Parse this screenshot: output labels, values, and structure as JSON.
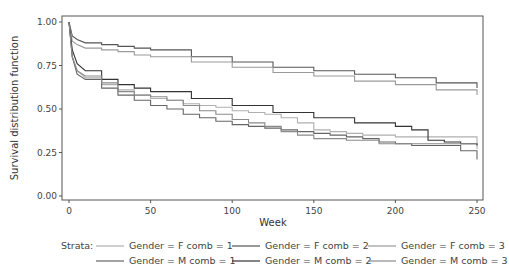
{
  "chart_data": {
    "type": "line",
    "title": "",
    "xlabel": "Week",
    "ylabel": "Survival distribution function",
    "xlim": [
      0,
      250
    ],
    "ylim": [
      0,
      1
    ],
    "xticks": [
      "0",
      "50",
      "100",
      "150",
      "200",
      "250"
    ],
    "yticks": [
      "0.00",
      "0.25",
      "0.50",
      "0.75",
      "1.00"
    ],
    "grid": false,
    "legend_position": "bottom",
    "legend_title": "Strata:",
    "step": true,
    "series": [
      {
        "name": "Gender = F comb = 1",
        "color": "#b0b0b0",
        "x": [
          0,
          2,
          5,
          10,
          20,
          30,
          40,
          50,
          60,
          70,
          80,
          90,
          100,
          110,
          120,
          130,
          140,
          150,
          160,
          170,
          180,
          190,
          200,
          210,
          220,
          230,
          240,
          250
        ],
        "y": [
          1.0,
          0.8,
          0.72,
          0.68,
          0.64,
          0.61,
          0.58,
          0.56,
          0.55,
          0.53,
          0.52,
          0.51,
          0.49,
          0.48,
          0.47,
          0.45,
          0.42,
          0.38,
          0.37,
          0.36,
          0.35,
          0.35,
          0.34,
          0.34,
          0.34,
          0.34,
          0.34,
          0.27
        ]
      },
      {
        "name": "Gender = F comb = 2",
        "color": "#555555",
        "x": [
          0,
          2,
          5,
          10,
          20,
          30,
          40,
          50,
          75,
          100,
          125,
          150,
          175,
          200,
          225,
          250
        ],
        "y": [
          1.0,
          0.92,
          0.9,
          0.88,
          0.87,
          0.86,
          0.85,
          0.84,
          0.8,
          0.77,
          0.74,
          0.72,
          0.7,
          0.68,
          0.65,
          0.62
        ]
      },
      {
        "name": "Gender = F comb = 3",
        "color": "#9a9a9a",
        "x": [
          0,
          2,
          5,
          10,
          20,
          30,
          40,
          50,
          75,
          100,
          125,
          150,
          175,
          200,
          225,
          250
        ],
        "y": [
          1.0,
          0.89,
          0.87,
          0.85,
          0.84,
          0.83,
          0.81,
          0.8,
          0.77,
          0.74,
          0.71,
          0.69,
          0.66,
          0.64,
          0.61,
          0.58
        ]
      },
      {
        "name": "Gender = M comb = 1",
        "color": "#666666",
        "x": [
          0,
          2,
          5,
          10,
          20,
          30,
          40,
          50,
          60,
          70,
          80,
          90,
          100,
          110,
          120,
          130,
          140,
          150,
          160,
          170,
          180,
          190,
          200,
          210,
          220,
          230,
          240,
          250
        ],
        "y": [
          1.0,
          0.8,
          0.7,
          0.67,
          0.62,
          0.58,
          0.55,
          0.52,
          0.5,
          0.47,
          0.45,
          0.43,
          0.41,
          0.4,
          0.39,
          0.38,
          0.37,
          0.36,
          0.35,
          0.34,
          0.33,
          0.31,
          0.3,
          0.29,
          0.29,
          0.29,
          0.26,
          0.21
        ]
      },
      {
        "name": "Gender = M comb = 2",
        "color": "#333333",
        "x": [
          0,
          2,
          5,
          10,
          20,
          30,
          40,
          50,
          75,
          100,
          125,
          150,
          175,
          200,
          210,
          220,
          230,
          240,
          250
        ],
        "y": [
          1.0,
          0.84,
          0.76,
          0.72,
          0.67,
          0.64,
          0.62,
          0.6,
          0.56,
          0.52,
          0.48,
          0.45,
          0.42,
          0.4,
          0.38,
          0.32,
          0.31,
          0.3,
          0.29
        ]
      },
      {
        "name": "Gender = M comb = 3",
        "color": "#8a8a8a",
        "x": [
          0,
          2,
          5,
          10,
          20,
          30,
          40,
          50,
          60,
          70,
          80,
          90,
          100,
          110,
          120,
          130,
          140,
          150,
          160,
          170,
          180,
          190,
          200,
          210,
          220,
          230,
          240,
          250
        ],
        "y": [
          1.0,
          0.8,
          0.72,
          0.69,
          0.65,
          0.6,
          0.58,
          0.57,
          0.55,
          0.52,
          0.49,
          0.47,
          0.44,
          0.42,
          0.4,
          0.37,
          0.35,
          0.33,
          0.33,
          0.32,
          0.32,
          0.3,
          0.3,
          0.3,
          0.3,
          0.3,
          0.3,
          0.3
        ]
      }
    ]
  },
  "legend": {
    "title": "Strata:",
    "items": [
      {
        "label": "Gender = F comb = 1",
        "color": "#b0b0b0"
      },
      {
        "label": "Gender = F comb = 2",
        "color": "#555555"
      },
      {
        "label": "Gender = F comb = 3",
        "color": "#9a9a9a"
      },
      {
        "label": "Gender = M comb = 1",
        "color": "#666666"
      },
      {
        "label": "Gender = M comb = 2",
        "color": "#333333"
      },
      {
        "label": "Gender = M comb = 3",
        "color": "#8a8a8a"
      }
    ]
  },
  "axes": {
    "xlabel": "Week",
    "ylabel": "Survival distribution function"
  }
}
